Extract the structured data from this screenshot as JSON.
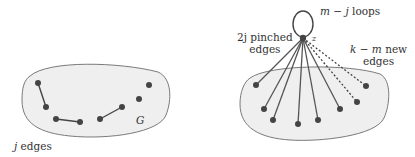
{
  "left_panel": {
    "graph_label": "G",
    "caption_var": "j",
    "caption_text": " edges",
    "colors": {
      "blob_fill": "#eeeeee",
      "blob_stroke": "#777777",
      "vertex": "#444444",
      "edge": "#444444"
    }
  },
  "right_panel": {
    "vertex_label": "z",
    "loops_var": "m − j",
    "loops_text": " loops",
    "pinched_var": "2j",
    "pinched_text": " pinched",
    "pinched_text2": "edges",
    "new_var": "k − m",
    "new_text": " new",
    "new_text2": "edges"
  }
}
